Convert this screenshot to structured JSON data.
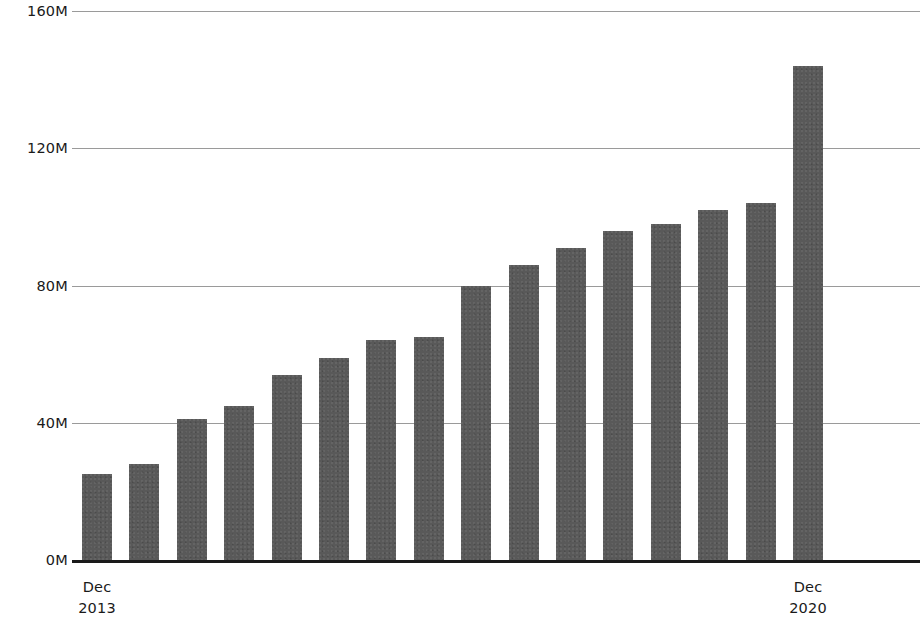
{
  "chart_data": {
    "type": "bar",
    "title": "",
    "subtitle": "",
    "xlabel": "",
    "ylabel": "",
    "ylim": [
      0,
      160
    ],
    "yunit": "M",
    "grid": true,
    "legend": "none",
    "bar_color": "#595959",
    "axis_color": "#1a1a1a",
    "gridline_color": "#9a9a9a",
    "y_ticks": [
      {
        "value": 0,
        "label": "0M"
      },
      {
        "value": 40,
        "label": "40M"
      },
      {
        "value": 80,
        "label": "80M"
      },
      {
        "value": 120,
        "label": "120M"
      },
      {
        "value": 160,
        "label": "160M"
      }
    ],
    "x_ticks": [
      {
        "index": 0,
        "line1": "Dec",
        "line2": "2013"
      },
      {
        "index": 15,
        "line1": "Dec",
        "line2": "2020"
      }
    ],
    "categories": [
      "Dec 2013",
      "2014 Q1",
      "2014 Q2",
      "2014 Q3",
      "2014 Q4",
      "2015 Q1",
      "2015 Q2",
      "2015 Q3",
      "2016",
      "2017 Q1",
      "2017 Q2",
      "2018 Q1",
      "2018 Q2",
      "2019 Q1",
      "2019 Q2",
      "Dec 2020"
    ],
    "values": [
      25,
      28,
      41,
      45,
      54,
      59,
      64,
      65,
      80,
      86,
      91,
      96,
      98,
      102,
      104,
      144
    ],
    "values_unit_label": [
      "25M",
      "28M",
      "41M",
      "45M",
      "54M",
      "59M",
      "64M",
      "65M",
      "80M",
      "86M",
      "91M",
      "96M",
      "98M",
      "102M",
      "104M",
      "144M"
    ]
  }
}
